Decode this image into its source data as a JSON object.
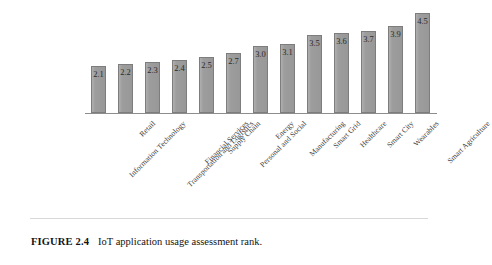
{
  "figure": {
    "caption_label": "FIGURE 2.4",
    "caption_text": "IoT application usage assessment rank.",
    "bar_color": "#9b9b9b",
    "bar_border_color": "#7d7d7d",
    "axis_color": "#8d8d8d",
    "text_color": "#3a3a3a"
  },
  "chart_data": {
    "type": "bar",
    "title": "IoT application usage assessment rank",
    "xlabel": "",
    "ylabel": "",
    "ylim": [
      0,
      4.8
    ],
    "grid": false,
    "legend": false,
    "categories": [
      "Information Technology",
      "Retail",
      "Transportation and Logistics",
      "Financial Services",
      "Supply Chain",
      "Personal and Social",
      "Energy",
      "Manufacturing",
      "Smart Grid",
      "Healthcare",
      "Smart City",
      "Wearables",
      "Smart Agriculture"
    ],
    "values": [
      2.1,
      2.2,
      2.3,
      2.4,
      2.5,
      2.7,
      3.0,
      3.1,
      3.5,
      3.6,
      3.7,
      3.9,
      4.5
    ],
    "data_labels": [
      "2.1",
      "2.2",
      "2.3",
      "2.4",
      "2.5",
      "2.7",
      "3.0",
      "3.1",
      "3.5",
      "3.6",
      "3.7",
      "3.9",
      "4.5"
    ]
  }
}
